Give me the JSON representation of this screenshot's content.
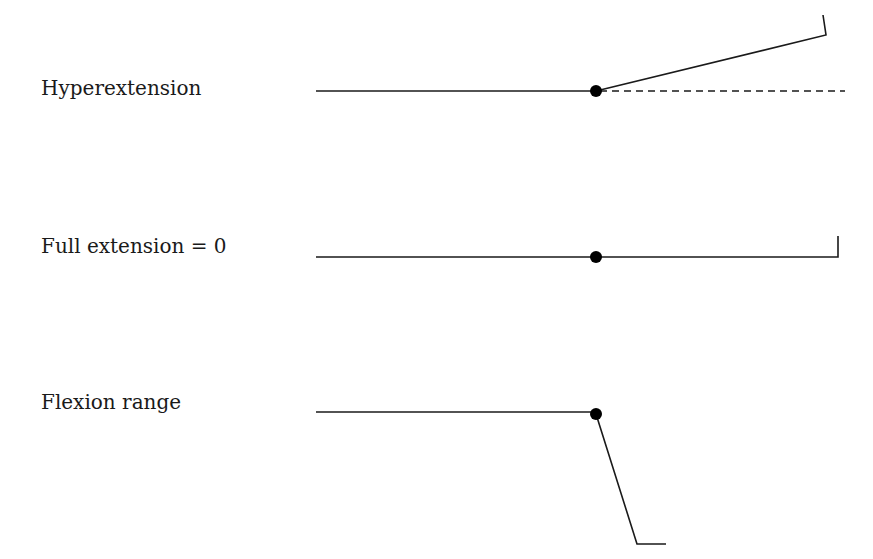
{
  "diagram": {
    "rows": [
      {
        "label": "Hyperextension"
      },
      {
        "label": "Full extension = 0"
      },
      {
        "label": "Flexion range"
      }
    ],
    "colors": {
      "line": "#1a1a1a",
      "background": "#ffffff"
    }
  }
}
